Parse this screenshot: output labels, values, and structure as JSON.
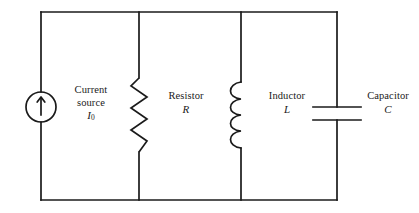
{
  "diagram": {
    "type": "electrical-circuit-schematic",
    "stroke_color": "#1a1a1a",
    "background_color": "#ffffff"
  },
  "components": {
    "current_source": {
      "name": "Current source",
      "label_line1": "Current",
      "label_line2": "source",
      "symbol_variable": "I",
      "symbol_subscript": "0",
      "icon": "circle-with-up-arrow",
      "arrow_direction": "up"
    },
    "resistor": {
      "name": "Resistor",
      "label_line1": "Resistor",
      "symbol_variable": "R",
      "icon": "zigzag-resistor"
    },
    "inductor": {
      "name": "Inductor",
      "label_line1": "Inductor",
      "symbol_variable": "L",
      "icon": "coil-inductor"
    },
    "capacitor": {
      "name": "Capacitor",
      "label_line1": "Capacitor",
      "symbol_variable": "C",
      "icon": "parallel-plate-capacitor"
    }
  }
}
